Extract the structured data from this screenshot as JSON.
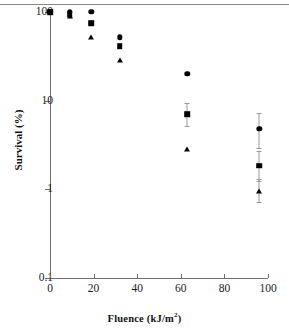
{
  "figure": {
    "title": "",
    "top_rule_color": "#8a8a8a",
    "axis_color": "#6f6f6f",
    "marker_color": "#000000"
  },
  "chart_data": {
    "type": "scatter",
    "title": "",
    "xlabel": "Fluence  (kJ/m2)",
    "xlabel_text": "Fluence  (kJ/m",
    "xlabel_sup": "2",
    "xlabel_tail": ")",
    "ylabel": "Survival (%)",
    "xscale": "linear",
    "yscale": "log",
    "xlim": [
      0,
      100
    ],
    "ylim": [
      0.1,
      100
    ],
    "grid": false,
    "legend": "none",
    "xticks": [
      0,
      20,
      40,
      60,
      80,
      100
    ],
    "xticklabels": [
      "0",
      "20",
      "40",
      "60",
      "80",
      "100"
    ],
    "yticks": [
      0.1,
      1,
      10,
      100
    ],
    "yticklabels": [
      "0.1",
      "1",
      "10",
      "100"
    ],
    "x": [
      0,
      9,
      19,
      32,
      63,
      96
    ],
    "series": [
      {
        "name": "circle",
        "marker": "circle",
        "values": [
          100,
          100,
          100,
          52,
          20,
          4.8
        ],
        "err_low": [
          0,
          0,
          0,
          0,
          0,
          2.9
        ],
        "err_high": [
          0,
          0,
          0,
          0,
          0,
          7.2
        ]
      },
      {
        "name": "square",
        "marker": "square",
        "values": [
          100,
          95,
          75,
          41,
          7.0,
          1.85
        ],
        "err_low": [
          0,
          0,
          0,
          0,
          5.2,
          1.25
        ],
        "err_high": [
          0,
          0,
          0,
          0,
          9.4,
          2.7
        ]
      },
      {
        "name": "triangle",
        "marker": "triangle",
        "values": [
          100,
          88,
          52,
          28,
          2.8,
          0.95
        ],
        "err_low": [
          0,
          0,
          0,
          0,
          0,
          0.72
        ],
        "err_high": [
          0,
          0,
          0,
          0,
          0,
          1.3
        ]
      }
    ]
  }
}
